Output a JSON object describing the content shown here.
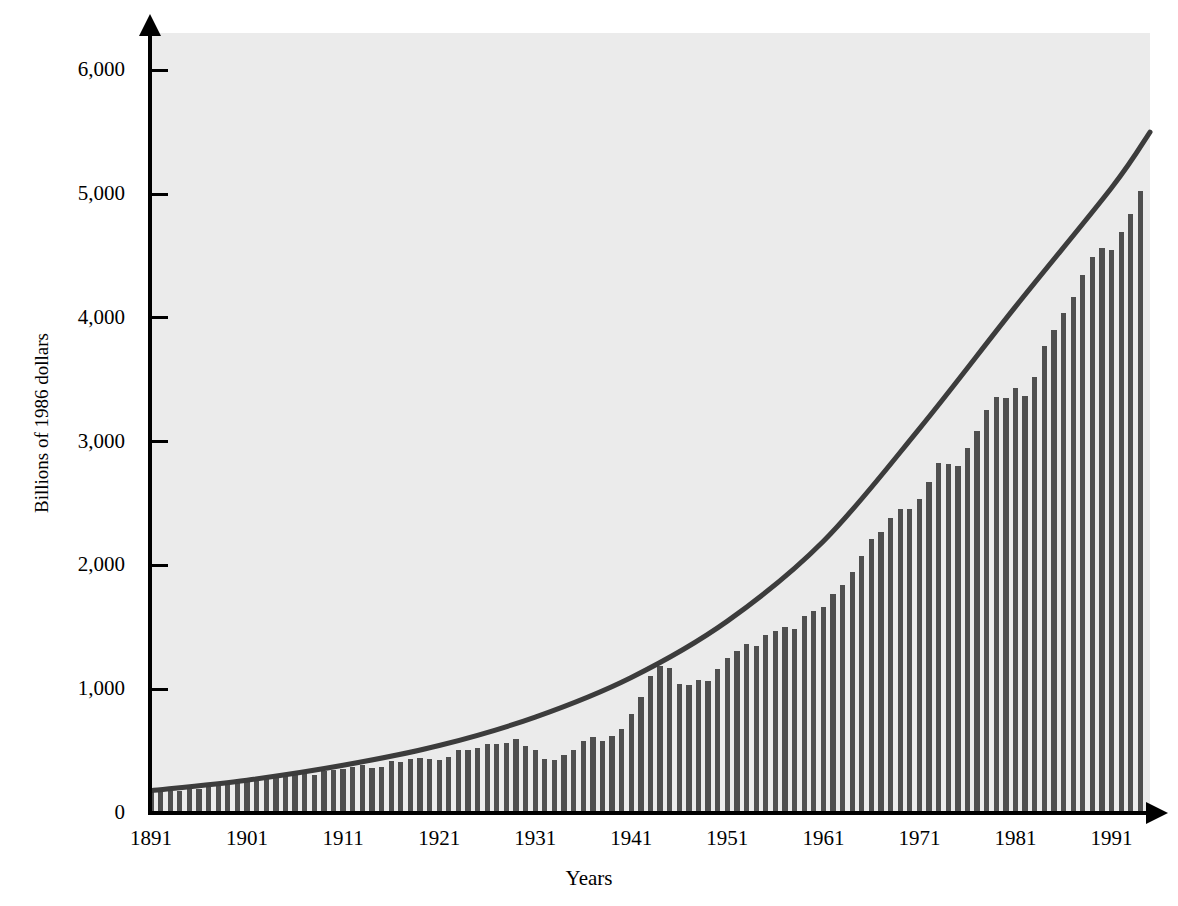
{
  "chart_data": {
    "type": "bar",
    "title": "",
    "subtitle": "",
    "xlabel": "Years",
    "ylabel": "Billions of 1986 dollars",
    "xlim": [
      1891,
      1995
    ],
    "ylim": [
      0,
      6300
    ],
    "grid": false,
    "legend": "none",
    "colors": {
      "plot_background": "#ebebeb",
      "bar": "#4f4f4f",
      "trend_line": "#3c3c3c",
      "axis": "#000000",
      "page_background": "#ffffff"
    },
    "y_ticks": [
      0,
      1000,
      2000,
      3000,
      4000,
      5000,
      6000
    ],
    "y_tick_labels": [
      "0",
      "1,000",
      "2,000",
      "3,000",
      "4,000",
      "5,000",
      "6,000"
    ],
    "x_ticks": [
      1891,
      1901,
      1911,
      1921,
      1931,
      1941,
      1951,
      1961,
      1971,
      1981,
      1991
    ],
    "x_tick_labels": [
      "1891",
      "1901",
      "1911",
      "1921",
      "1931",
      "1941",
      "1951",
      "1961",
      "1971",
      "1981",
      "1991"
    ],
    "series": [
      {
        "name": "Real GNP",
        "kind": "bar",
        "x": [
          1891,
          1892,
          1893,
          1894,
          1895,
          1896,
          1897,
          1898,
          1899,
          1900,
          1901,
          1902,
          1903,
          1904,
          1905,
          1906,
          1907,
          1908,
          1909,
          1910,
          1911,
          1912,
          1913,
          1914,
          1915,
          1916,
          1917,
          1918,
          1919,
          1920,
          1921,
          1922,
          1923,
          1924,
          1925,
          1926,
          1927,
          1928,
          1929,
          1930,
          1931,
          1932,
          1933,
          1934,
          1935,
          1936,
          1937,
          1938,
          1939,
          1940,
          1941,
          1942,
          1943,
          1944,
          1945,
          1946,
          1947,
          1948,
          1949,
          1950,
          1951,
          1952,
          1953,
          1954,
          1955,
          1956,
          1957,
          1958,
          1959,
          1960,
          1961,
          1962,
          1963,
          1964,
          1965,
          1966,
          1967,
          1968,
          1969,
          1970,
          1971,
          1972,
          1973,
          1974,
          1975,
          1976,
          1977,
          1978,
          1979,
          1980,
          1981,
          1982,
          1983,
          1984,
          1985,
          1986,
          1987,
          1988,
          1989,
          1990,
          1991,
          1992,
          1993,
          1994
        ],
        "values": [
          175,
          190,
          180,
          175,
          195,
          190,
          210,
          220,
          235,
          245,
          270,
          275,
          285,
          280,
          300,
          330,
          335,
          305,
          340,
          345,
          355,
          375,
          385,
          360,
          370,
          420,
          415,
          440,
          445,
          440,
          425,
          450,
          505,
          510,
          525,
          560,
          560,
          565,
          600,
          545,
          505,
          435,
          430,
          470,
          510,
          580,
          610,
          580,
          625,
          680,
          800,
          940,
          1105,
          1190,
          1175,
          1040,
          1030,
          1075,
          1070,
          1165,
          1255,
          1305,
          1365,
          1345,
          1440,
          1470,
          1500,
          1485,
          1590,
          1630,
          1665,
          1765,
          1845,
          1950,
          2075,
          2210,
          2270,
          2380,
          2455,
          2455,
          2540,
          2675,
          2830,
          2815,
          2800,
          2950,
          3085,
          3255,
          3360,
          3350,
          3435,
          3370,
          3520,
          3770,
          3905,
          4035,
          4170,
          4345,
          4490,
          4565,
          4545,
          4690,
          4840,
          5020
        ],
        "bar_color": "#4f4f4f"
      },
      {
        "name": "Exponential trend",
        "kind": "line",
        "x": [
          1891,
          1901,
          1911,
          1921,
          1931,
          1941,
          1951,
          1961,
          1971,
          1981,
          1991,
          1995
        ],
        "values": [
          180,
          265,
          385,
          545,
          775,
          1095,
          1550,
          2195,
          3105,
          4090,
          5050,
          5500
        ],
        "line_color": "#3c3c3c",
        "line_width": 5
      }
    ],
    "annotations": []
  },
  "axis_titles": {
    "y": "Billions of 1986 dollars",
    "x": "Years"
  }
}
